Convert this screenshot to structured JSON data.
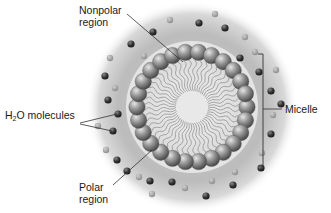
{
  "diagram": {
    "labels": {
      "nonpolar_line1": "Nonpolar",
      "nonpolar_line2": "region",
      "water_prefix": "H",
      "water_sub": "2",
      "water_suffix": "O molecules",
      "polar_line1": "Polar",
      "polar_line2": "region",
      "micelle": "Micelle"
    },
    "components": {
      "polar_heads_count": 26,
      "structure": "spherical micelle with polar heads outward and nonpolar tails inward, surrounded by water molecules"
    },
    "colors": {
      "background": "#ffffff",
      "halo": "#bdbdbd",
      "sphere_light": "#d0d0d0",
      "sphere_dark": "#5a5a5a",
      "water_dark": "#2e2e2e",
      "line": "#333333"
    }
  }
}
